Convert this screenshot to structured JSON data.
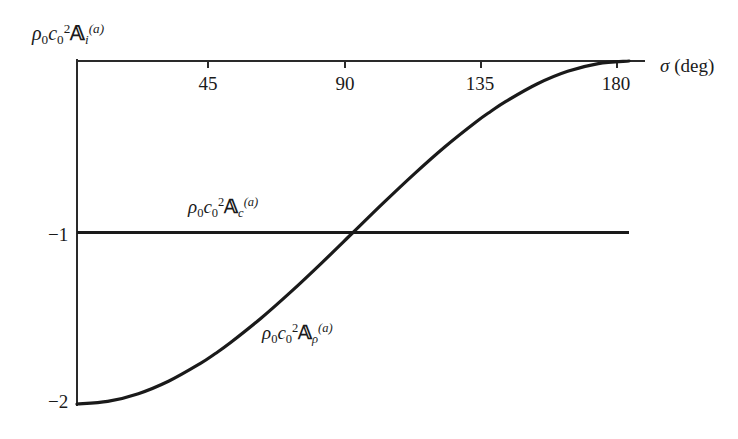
{
  "chart_data": {
    "type": "line",
    "title": "",
    "subtitle": "",
    "xlabel": "σ (deg)",
    "ylabel": "ρ₀c₀²𝔸ᵢ⁽ᵃ⁾",
    "xlim": [
      0,
      180
    ],
    "ylim": [
      -2,
      0
    ],
    "xticks": [
      45,
      90,
      135,
      180
    ],
    "xticklabels": [
      "45",
      "90",
      "135",
      "180"
    ],
    "yticks": [
      -1,
      -2
    ],
    "yticklabels": [
      "-1",
      "-2"
    ],
    "grid": false,
    "legend_position": "inline-annotation",
    "x": [
      0,
      10,
      20,
      30,
      40,
      45,
      50,
      60,
      70,
      80,
      90,
      100,
      110,
      120,
      130,
      135,
      140,
      150,
      160,
      170,
      180
    ],
    "series": [
      {
        "name": "ρ₀c₀²𝔸_c⁽ᵃ⁾",
        "label_text": "rho0 c0^2 A_c^(a)",
        "kind": "constant",
        "color": "#1a1a1a",
        "values": [
          -1,
          -1,
          -1,
          -1,
          -1,
          -1,
          -1,
          -1,
          -1,
          -1,
          -1,
          -1,
          -1,
          -1,
          -1,
          -1,
          -1,
          -1,
          -1,
          -1,
          -1
        ]
      },
      {
        "name": "ρ₀c₀²𝔸_ρ⁽ᵃ⁾",
        "label_text": "rho0 c0^2 A_rho^(a)",
        "kind": "negative-one-minus-cos",
        "color": "#1a1a1a",
        "values": [
          -2.0,
          -1.985,
          -1.94,
          -1.866,
          -1.766,
          -1.707,
          -1.643,
          -1.5,
          -1.342,
          -1.174,
          -1.0,
          -0.826,
          -0.658,
          -0.5,
          -0.357,
          -0.293,
          -0.234,
          -0.134,
          -0.06,
          -0.015,
          0.0
        ]
      }
    ],
    "annotations": [
      {
        "name": "curve-label-c",
        "text": "rho0 c0^2 A_c^(a)",
        "x": 30,
        "y": -0.85
      },
      {
        "name": "curve-label-rho",
        "text": "rho0 c0^2 A_rho^(a)",
        "x": 72,
        "y": -1.62
      },
      {
        "name": "y-axis-label",
        "text": "rho0 c0^2 A_i^(a)",
        "x": 0,
        "y": 0.2
      }
    ]
  },
  "axis": {
    "x_title_symbol": "σ",
    "x_title_unit": "(deg)",
    "ticks": {
      "t45": "45",
      "t90": "90",
      "t135": "135",
      "t180": "180"
    },
    "y_labels": {
      "minus_one": "−1",
      "minus_two": "−2"
    }
  },
  "symbols": {
    "rho": "ρ",
    "c": "c",
    "zero": "0",
    "two": "2",
    "A": "𝔸",
    "sub_i": "i",
    "sub_c": "c",
    "sub_rho": "ρ",
    "sup_a": "(a)"
  },
  "colors": {
    "background": "#ffffff",
    "ink": "#1a1a1a",
    "axis": "#2a2a2a",
    "curve": "#1a1a1a"
  }
}
